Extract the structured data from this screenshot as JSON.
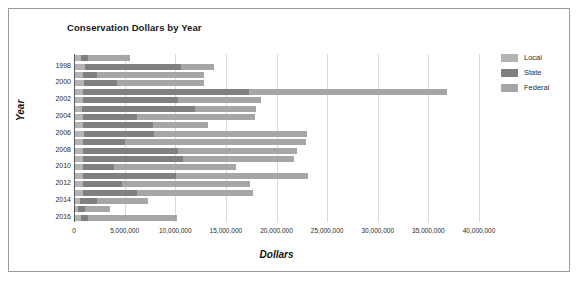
{
  "chart_data": {
    "type": "bar",
    "orientation": "horizontal",
    "stacked": true,
    "title": "Conservation Dollars by Year",
    "xlabel": "Dollars",
    "ylabel": "Year",
    "xlim": [
      0,
      40000000
    ],
    "grid": true,
    "legend_position": "right",
    "xticks": [
      "0",
      "5,000,000",
      "10,000,000",
      "15,000,000",
      "20,000,000",
      "25,000,000",
      "30,000,000",
      "35,000,000",
      "40,000,000"
    ],
    "xtick_values": [
      0,
      5000000,
      10000000,
      15000000,
      20000000,
      25000000,
      30000000,
      35000000,
      40000000
    ],
    "categories": [
      "1997",
      "1998",
      "1999",
      "2000",
      "2001",
      "2002",
      "2003",
      "2004",
      "2005",
      "2006",
      "2007",
      "2008",
      "2009",
      "2010",
      "2011",
      "2012",
      "2013",
      "2014",
      "2015",
      "2016"
    ],
    "visible_category_labels": [
      "1998",
      "2000",
      "2002",
      "2004",
      "2006",
      "2008",
      "2010",
      "2012",
      "2014",
      "2016"
    ],
    "series": [
      {
        "name": "Local",
        "color": "#b3b3b3",
        "values": [
          700000,
          1100000,
          900000,
          1000000,
          900000,
          900000,
          800000,
          900000,
          900000,
          1000000,
          900000,
          900000,
          900000,
          900000,
          900000,
          900000,
          900000,
          600000,
          400000,
          700000
        ]
      },
      {
        "name": "State",
        "color": "#808080",
        "values": [
          700000,
          9500000,
          1400000,
          3200000,
          16400000,
          9400000,
          11200000,
          5300000,
          6900000,
          6900000,
          4100000,
          9400000,
          9900000,
          3100000,
          9200000,
          3800000,
          5300000,
          1700000,
          700000,
          700000
        ]
      },
      {
        "name": "Federal",
        "color": "#a6a6a6",
        "values": [
          4100000,
          3200000,
          10500000,
          8600000,
          19500000,
          8200000,
          6000000,
          11700000,
          5400000,
          15100000,
          17900000,
          11700000,
          10900000,
          12000000,
          13000000,
          12700000,
          11500000,
          5000000,
          2500000,
          8800000
        ]
      }
    ]
  },
  "chart": {
    "title": "Conservation Dollars by Year",
    "xaxis_title": "Dollars",
    "yaxis_title": "Year"
  },
  "legend": {
    "items": [
      {
        "label": "Local",
        "color": "#b3b3b3"
      },
      {
        "label": "State",
        "color": "#808080"
      },
      {
        "label": "Federal",
        "color": "#a6a6a6"
      }
    ]
  }
}
